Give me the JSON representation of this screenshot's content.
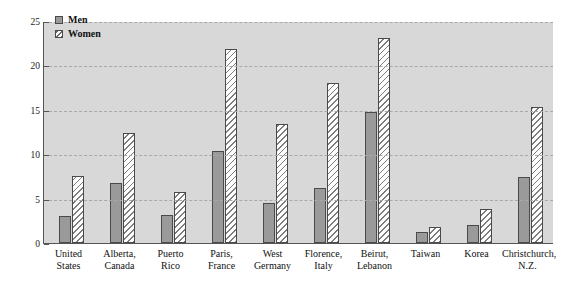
{
  "chart_data": {
    "type": "bar",
    "title": "",
    "xlabel": "",
    "ylabel": "Lifetime Rate of Depression",
    "ylim": [
      0,
      25
    ],
    "yticks": [
      0,
      5,
      10,
      15,
      20,
      25
    ],
    "grid": true,
    "legend_position": "top-left",
    "categories": [
      "United States",
      "Alberta, Canada",
      "Puerto Rico",
      "Paris, France",
      "West Germany",
      "Florence, Italy",
      "Beirut, Lebanon",
      "Taiwan",
      "Korea",
      "Christchurch, N.Z."
    ],
    "category_lines": [
      [
        "United",
        "States"
      ],
      [
        "Alberta,",
        "Canada"
      ],
      [
        "Puerto",
        "Rico"
      ],
      [
        "Paris,",
        "France"
      ],
      [
        "West",
        "Germany"
      ],
      [
        "Florence,",
        "Italy"
      ],
      [
        "Beirut,",
        "Lebanon"
      ],
      [
        "Taiwan",
        ""
      ],
      [
        "Korea",
        ""
      ],
      [
        "Christchurch,",
        "N.Z."
      ]
    ],
    "series": [
      {
        "name": "Men",
        "values": [
          3.0,
          6.8,
          3.2,
          10.4,
          4.5,
          6.2,
          14.7,
          1.2,
          2.0,
          7.4
        ]
      },
      {
        "name": "Women",
        "values": [
          7.5,
          12.4,
          5.7,
          21.8,
          13.4,
          18.0,
          23.1,
          1.8,
          3.8,
          15.3
        ]
      }
    ]
  },
  "legend": {
    "items": [
      {
        "label": "Men"
      },
      {
        "label": "Women"
      }
    ]
  },
  "axes": {
    "y_title": "Lifetime Rate of Depression",
    "y_tick_labels": [
      "0",
      "5",
      "10",
      "15",
      "20",
      "25"
    ]
  },
  "colors": {
    "plot_background": "#d8d8d8",
    "men_fill": "#9a9a9a",
    "women_fill": "#fdfdfd",
    "bar_border": "#4a4a4a",
    "gridline": "#a9a9a9",
    "axis": "#555555",
    "text": "#111111"
  }
}
